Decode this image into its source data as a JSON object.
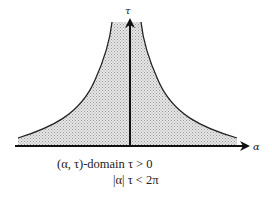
{
  "diagram": {
    "axes": {
      "horizontal_label": "α",
      "vertical_label": "τ"
    },
    "region": {
      "fill_pattern": "stippled-gray",
      "fill_color": "#cfcfcf",
      "boundary_color": "#222222"
    },
    "captions": {
      "line1": "(α, τ)-domain τ > 0",
      "line2": "|α| τ < 2π"
    }
  }
}
